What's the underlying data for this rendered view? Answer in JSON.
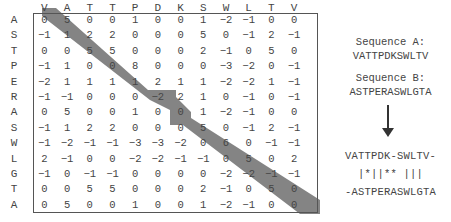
{
  "matrix": {
    "col_headers": [
      "V",
      "A",
      "T",
      "T",
      "P",
      "D",
      "K",
      "S",
      "W",
      "L",
      "T",
      "V"
    ],
    "row_headers": [
      "A",
      "S",
      "T",
      "P",
      "E",
      "R",
      "A",
      "S",
      "W",
      "L",
      "G",
      "T",
      "A"
    ],
    "rows": [
      [
        "0",
        "5",
        "0",
        "0",
        "1",
        "0",
        "0",
        "1",
        "-2",
        "-1",
        "0",
        "0"
      ],
      [
        "-1",
        "1",
        "2",
        "2",
        "0",
        "0",
        "0",
        "5",
        "0",
        "-1",
        "2",
        "-1"
      ],
      [
        "0",
        "0",
        "5",
        "5",
        "0",
        "0",
        "0",
        "2",
        "-1",
        "0",
        "5",
        "0"
      ],
      [
        "-1",
        "1",
        "0",
        "0",
        "8",
        "0",
        "0",
        "0",
        "-3",
        "-2",
        "0",
        "-1"
      ],
      [
        "-2",
        "1",
        "1",
        "1",
        "1",
        "2",
        "1",
        "1",
        "-2",
        "-2",
        "1",
        "-1"
      ],
      [
        "-1",
        "-1",
        "0",
        "0",
        "0",
        "-2",
        "2",
        "1",
        "0",
        "-1",
        "0",
        "-1"
      ],
      [
        "0",
        "5",
        "0",
        "0",
        "1",
        "0",
        "0",
        "1",
        "-2",
        "-1",
        "0",
        "0"
      ],
      [
        "-1",
        "1",
        "2",
        "2",
        "0",
        "0",
        "0",
        "5",
        "0",
        "-1",
        "2",
        "-1"
      ],
      [
        "-1",
        "-2",
        "-1",
        "-1",
        "-3",
        "-3",
        "-2",
        "0",
        "6",
        "0",
        "-1",
        "-1"
      ],
      [
        "2",
        "-1",
        "0",
        "0",
        "-2",
        "-2",
        "-1",
        "-1",
        "0",
        "5",
        "0",
        "2"
      ],
      [
        "-1",
        "0",
        "-1",
        "-1",
        "0",
        "0",
        "0",
        "0",
        "-2",
        "-2",
        "-1",
        "-1"
      ],
      [
        "0",
        "0",
        "5",
        "5",
        "0",
        "0",
        "0",
        "2",
        "-1",
        "0",
        "5",
        "0"
      ],
      [
        "0",
        "5",
        "0",
        "0",
        "1",
        "0",
        "0",
        "1",
        "-2",
        "-1",
        "0",
        "0"
      ]
    ],
    "band_color": "#777777"
  },
  "panel": {
    "seq_a_label": "Sequence A:",
    "seq_a": "VATTPDKSWLTV",
    "seq_b_label": "Sequence B:",
    "seq_b": "ASTPERASWLGTA",
    "aligned_a": "VATTPDK-SWLTV-",
    "match_line": "|*||** |||",
    "aligned_b": "-ASTPERASWLGTA"
  }
}
